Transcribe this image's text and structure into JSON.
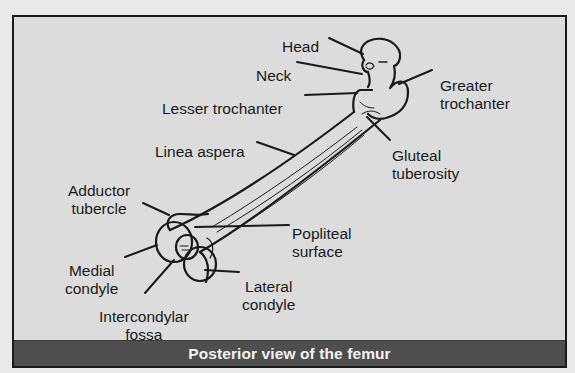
{
  "figure": {
    "caption": "Posterior view of the femur",
    "colors": {
      "page_background": "#e9e9e9",
      "figure_background": "#dcdcdc",
      "border": "#1b1b1b",
      "caption_bar": "#4e4e4e",
      "caption_text": "#f2f2f2",
      "label_text": "#1a1a1a"
    },
    "labels": {
      "head": "Head",
      "neck": "Neck",
      "lesser_trochanter": "Lesser trochanter",
      "greater_trochanter_1": "Greater",
      "greater_trochanter_2": "trochanter",
      "linea_aspera": "Linea aspera",
      "gluteal_tuberosity_1": "Gluteal",
      "gluteal_tuberosity_2": "tuberosity",
      "adductor_tubercle_1": "Adductor",
      "adductor_tubercle_2": "tubercle",
      "popliteal_surface_1": "Popliteal",
      "popliteal_surface_2": "surface",
      "medial_condyle_1": "Medial",
      "medial_condyle_2": "condyle",
      "lateral_condyle_1": "Lateral",
      "lateral_condyle_2": "condyle",
      "intercondylar_fossa_1": "Intercondylar",
      "intercondylar_fossa_2": "fossa"
    }
  }
}
